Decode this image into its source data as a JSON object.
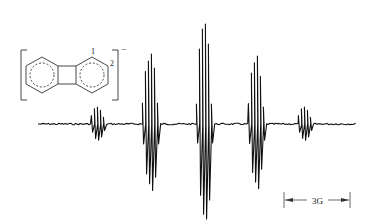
{
  "figure": {
    "type": "ESR spectrum",
    "molecule": {
      "name": "biphenylene radical anion",
      "charge_label": "−",
      "position_labels": [
        "1",
        "2"
      ]
    },
    "scale_bar": {
      "label": "3G"
    },
    "spectrum": {
      "baseline_y": 124,
      "x_start": 38,
      "x_end": 355,
      "groups": [
        {
          "center_x": 97,
          "amplitude": 17,
          "lines": [
            [
              -5,
              0.5
            ],
            [
              -2,
              0.9
            ],
            [
              1,
              1.0
            ],
            [
              4,
              0.8
            ],
            [
              7,
              0.4
            ]
          ]
        },
        {
          "center_x": 150,
          "amplitude": 70,
          "lines": [
            [
              -7,
              0.3
            ],
            [
              -4,
              0.75
            ],
            [
              -1,
              0.9
            ],
            [
              2,
              1.0
            ],
            [
              5,
              0.8
            ],
            [
              8,
              0.3
            ]
          ]
        },
        {
          "center_x": 205,
          "amplitude": 100,
          "lines": [
            [
              -8,
              0.2
            ],
            [
              -5,
              0.75
            ],
            [
              -2,
              0.95
            ],
            [
              1,
              1.0
            ],
            [
              4,
              0.8
            ],
            [
              7,
              0.2
            ]
          ]
        },
        {
          "center_x": 256,
          "amplitude": 68,
          "lines": [
            [
              -7,
              0.3
            ],
            [
              -4,
              0.75
            ],
            [
              -1,
              0.9
            ],
            [
              2,
              1.0
            ],
            [
              5,
              0.7
            ],
            [
              8,
              0.25
            ]
          ]
        },
        {
          "center_x": 304,
          "amplitude": 17,
          "lines": [
            [
              -5,
              0.5
            ],
            [
              -2,
              0.9
            ],
            [
              1,
              1.0
            ],
            [
              4,
              0.8
            ],
            [
              7,
              0.4
            ]
          ]
        }
      ]
    }
  }
}
